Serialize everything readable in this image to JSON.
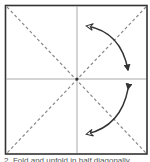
{
  "diagram": {
    "type": "origami-step",
    "paper": {
      "shape": "square",
      "border_color": "#333333",
      "fill": "#ffffff"
    },
    "creases": [
      {
        "kind": "valley-fold-dashed",
        "from": "top-left",
        "to": "bottom-right",
        "color": "#888888"
      },
      {
        "kind": "valley-fold-dashed",
        "from": "top-right",
        "to": "bottom-left",
        "color": "#888888"
      },
      {
        "kind": "existing-crease",
        "orientation": "vertical",
        "color": "#aaaaaa"
      },
      {
        "kind": "existing-crease",
        "orientation": "horizontal",
        "color": "#aaaaaa"
      }
    ],
    "arrows": [
      {
        "name": "fold-and-unfold-arrow-upper",
        "style": "curved-two-way",
        "color": "#333333"
      },
      {
        "name": "fold-and-unfold-arrow-lower",
        "style": "curved-two-way",
        "color": "#333333"
      }
    ]
  },
  "caption": {
    "text": "2. Fold and unfold in half diagonally."
  }
}
